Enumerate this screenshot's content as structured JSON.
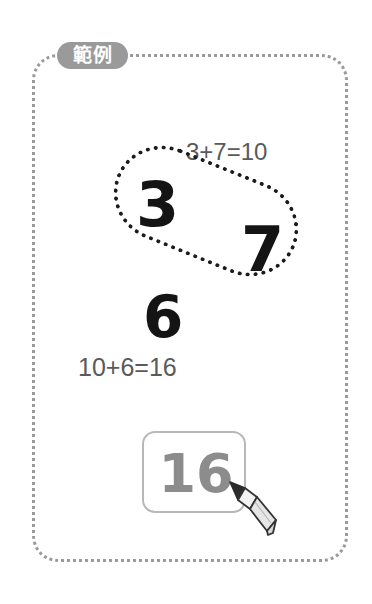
{
  "page": {
    "background_color": "#ffffff",
    "width": 372,
    "height": 604
  },
  "panel": {
    "badge_label": "範例",
    "badge_color": "#9a9a9a",
    "badge_text_color": "#ffffff",
    "border_style": "dotted",
    "border_color": "#9a9a9a"
  },
  "worksheet": {
    "equation_top": "3+7=10",
    "equation_middle": "10+6=16",
    "equation_color": "#5a5a5a",
    "grouped_numbers": [
      {
        "value": "3",
        "name": "numeral-three"
      },
      {
        "value": "7",
        "name": "numeral-seven"
      }
    ],
    "lasso": {
      "shape": "dotted-ellipse",
      "color": "#1c1c1c",
      "rotation_deg": 22
    },
    "loose_number": "6",
    "numeral_color": "#141414"
  },
  "answer": {
    "value": "16",
    "placeholder": "",
    "text_color": "#8c8c8c",
    "border_color": "#b8b8b8"
  },
  "cursor": {
    "icon": "pencil-icon",
    "tip_color": "#2b2b2b",
    "body_color": "#e8e8e8",
    "outline_color": "#333333"
  }
}
